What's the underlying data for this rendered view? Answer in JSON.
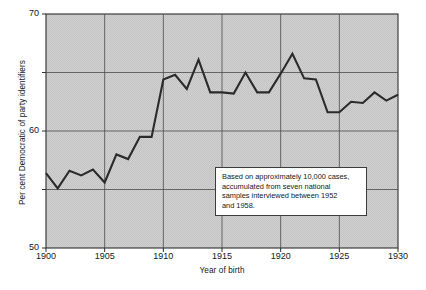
{
  "chart_data": {
    "type": "line",
    "title": "",
    "subtitle": "",
    "xlabel": "Year of birth",
    "ylabel": "Per cent Democratic of party identifiers",
    "xlim": [
      1900,
      1930
    ],
    "ylim": [
      50,
      70
    ],
    "grid": true,
    "legend": null,
    "xticks": [
      1900,
      1905,
      1910,
      1915,
      1920,
      1925,
      1930
    ],
    "xtick_labels": [
      "1900",
      "1905",
      "1910",
      "1915",
      "1920",
      "1925",
      "1930"
    ],
    "yticks": [
      50,
      55,
      60,
      65,
      70
    ],
    "ytick_labels": [
      "50",
      "55",
      "60",
      "65",
      "70"
    ],
    "ytick_labels_shown": [
      "50",
      "60",
      "70"
    ],
    "gridlines_y": [
      55,
      60,
      65
    ],
    "gridlines_x": [
      1905,
      1910,
      1915,
      1920,
      1925
    ],
    "plot_background": "#cfcfcf",
    "line_color": "#2b2b2b",
    "x": [
      1900,
      1901,
      1902,
      1903,
      1904,
      1905,
      1906,
      1907,
      1908,
      1909,
      1910,
      1911,
      1912,
      1913,
      1914,
      1915,
      1916,
      1917,
      1918,
      1919,
      1920,
      1921,
      1922,
      1923,
      1924,
      1925,
      1926,
      1927,
      1928,
      1929,
      1930
    ],
    "values": [
      56.4,
      55.1,
      56.6,
      56.2,
      56.7,
      55.6,
      58.0,
      57.6,
      59.5,
      59.5,
      64.4,
      64.8,
      63.6,
      66.1,
      63.3,
      63.3,
      63.2,
      65.0,
      63.3,
      63.3,
      64.9,
      66.6,
      64.5,
      64.4,
      61.6,
      61.6,
      62.5,
      62.4,
      63.3,
      62.6,
      63.1
    ],
    "series": [
      {
        "name": "Per cent Democratic of party identifiers",
        "values": [
          56.4,
          55.1,
          56.6,
          56.2,
          56.7,
          55.6,
          58.0,
          57.6,
          59.5,
          59.5,
          64.4,
          64.8,
          63.6,
          66.1,
          63.3,
          63.3,
          63.2,
          65.0,
          63.3,
          63.3,
          64.9,
          66.6,
          64.5,
          64.4,
          61.6,
          61.6,
          62.5,
          62.4,
          63.3,
          62.6,
          63.1
        ]
      }
    ],
    "annotation": {
      "line1": "Based on approximately 10,000 cases,",
      "line2": "accumulated from seven national",
      "line3": "samples interviewed between 1952",
      "line4": "and 1958."
    }
  }
}
